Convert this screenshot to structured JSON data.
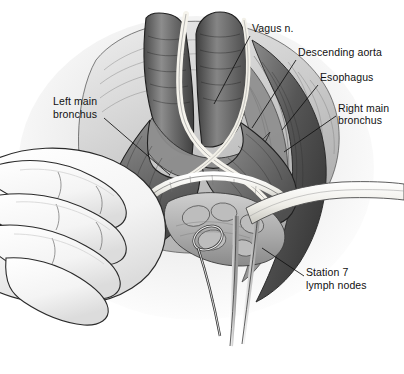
{
  "figure": {
    "kind": "medical-illustration",
    "background_color": "#ffffff",
    "ink_color": "#111111",
    "style": "grayscale pen-and-ink with airbrush tone"
  },
  "labels": [
    {
      "id": "vagus",
      "text": "Vagus n.",
      "x": 252,
      "y": 28
    },
    {
      "id": "aorta",
      "text": "Descending aorta",
      "x": 298,
      "y": 52
    },
    {
      "id": "esophagus",
      "text": "Esophagus",
      "x": 320,
      "y": 77
    },
    {
      "id": "right-bronchus-l1",
      "text": "Right main",
      "x": 338,
      "y": 108
    },
    {
      "id": "right-bronchus-l2",
      "text": "bronchus",
      "x": 338,
      "y": 120
    },
    {
      "id": "left-bronchus-l1",
      "text": "Left main",
      "x": 53,
      "y": 101
    },
    {
      "id": "left-bronchus-l2",
      "text": "bronchus",
      "x": 53,
      "y": 114
    },
    {
      "id": "station7-l1",
      "text": "Station 7",
      "x": 306,
      "y": 272
    },
    {
      "id": "station7-l2",
      "text": "lymph nodes",
      "x": 306,
      "y": 285
    }
  ],
  "leaders": [
    {
      "id": "leader-vagus",
      "x1": 250,
      "y1": 36,
      "x2": 214,
      "y2": 104
    },
    {
      "id": "leader-aorta",
      "x1": 296,
      "y1": 60,
      "x2": 252,
      "y2": 128
    },
    {
      "id": "leader-esophagus",
      "x1": 318,
      "y1": 85,
      "x2": 282,
      "y2": 130
    },
    {
      "id": "leader-right-bronchus",
      "x1": 336,
      "y1": 116,
      "x2": 284,
      "y2": 152
    },
    {
      "id": "leader-left-bronchus",
      "x1": 104,
      "y1": 118,
      "x2": 170,
      "y2": 175
    },
    {
      "id": "leader-station7",
      "x1": 304,
      "y1": 276,
      "x2": 262,
      "y2": 248
    }
  ],
  "structures": [
    {
      "id": "trachea",
      "name": "trachea / tracheal trunk",
      "tone": "#6e6e6e"
    },
    {
      "id": "left-main-bronchus",
      "name": "left main bronchus",
      "tone": "#7a7a7a"
    },
    {
      "id": "right-main-bronchus",
      "name": "right main bronchus",
      "tone": "#8a8a8a"
    },
    {
      "id": "carina",
      "name": "carina / tracheal bifurcation",
      "tone": "#9a9a9a"
    },
    {
      "id": "vagus-nerve",
      "name": "vagus nerve",
      "tone": "#f2f0ea"
    },
    {
      "id": "descending-aorta",
      "name": "descending aorta",
      "tone": "#5d5d5d"
    },
    {
      "id": "esophagus-body",
      "name": "esophagus",
      "tone": "#8e8e8e"
    },
    {
      "id": "station7-nodes",
      "name": "station 7 subcarinal lymph nodes",
      "tone": "#b4b4b4"
    },
    {
      "id": "surgeon-hand",
      "name": "gloved surgeon hand",
      "tone": "#fbfbfb"
    },
    {
      "id": "retractor-tape",
      "name": "retractor tape / vessel loop",
      "tone": "#f4f2ec"
    },
    {
      "id": "ring-forceps",
      "name": "ring forceps on nodal packet",
      "tone": "#c9c9c9"
    },
    {
      "id": "instrument-shafts",
      "name": "instrument shafts",
      "tone": "#d7d7d7"
    }
  ]
}
